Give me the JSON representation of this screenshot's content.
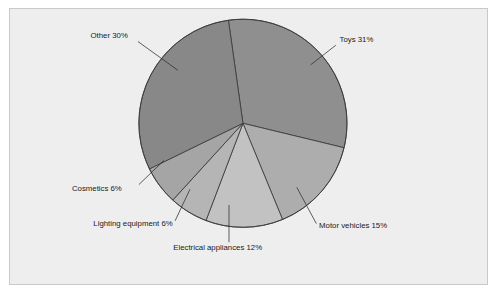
{
  "figure": {
    "background_color": "#ffffff",
    "panel_color": "#eeeeee",
    "panel_border_color": "#c9c9c9"
  },
  "chart_data": {
    "type": "pie",
    "title": "",
    "subtitle": "",
    "xlabel": "",
    "ylabel": "",
    "legend_position": "none",
    "grid": false,
    "labels_show_percent": true,
    "categories": [
      "Toys",
      "Motor vehicles",
      "Electrical appliances",
      "Lighting equipment",
      "Cosmetics",
      "Other"
    ],
    "values": [
      31,
      15,
      12,
      6,
      6,
      30
    ],
    "units": "%",
    "total": 100,
    "start_angle_deg": -98,
    "direction": "clockwise",
    "slices": [
      {
        "name": "Toys",
        "value": 31,
        "label": "Toys 31%",
        "color": "#8f8f8f",
        "label_x": 358,
        "label_y": 44,
        "label_anchor": "start",
        "leader_x1": 354,
        "leader_y1": 48,
        "leader_x2": 327,
        "leader_y2": 69
      },
      {
        "name": "Motor vehicles",
        "value": 15,
        "label": "Motor vehicles 15%",
        "color": "#adadad",
        "label_x": 336,
        "label_y": 245,
        "label_anchor": "start",
        "leader_x1": 333,
        "leader_y1": 240,
        "leader_x2": 312,
        "leader_y2": 201
      },
      {
        "name": "Electrical appliances",
        "value": 12,
        "label": "Electrical appliances 12%",
        "color": "#c2c2c2",
        "label_x": 179,
        "label_y": 268,
        "label_anchor": "start",
        "leader_x1": 239,
        "leader_y1": 260,
        "leader_x2": 239,
        "leader_y2": 220
      },
      {
        "name": "Lighting equipment",
        "value": 6,
        "label": "Lighting equipment 6%",
        "color": "#b5b5b5",
        "label_x": 93,
        "label_y": 243,
        "label_anchor": "start",
        "leader_x1": 181,
        "leader_y1": 237,
        "leader_x2": 197,
        "leader_y2": 203
      },
      {
        "name": "Cosmetics",
        "value": 6,
        "label": "Cosmetics 6%",
        "color": "#a5a5a5",
        "label_x": 70,
        "label_y": 205,
        "label_anchor": "start",
        "leader_x1": 142,
        "leader_y1": 198,
        "leader_x2": 169,
        "leader_y2": 172
      },
      {
        "name": "Other",
        "value": 30,
        "label": "Other 30%",
        "color": "#888888",
        "label_x": 90,
        "label_y": 40,
        "label_anchor": "start",
        "leader_x1": 141,
        "leader_y1": 44,
        "leader_x2": 184,
        "leader_y2": 75
      }
    ],
    "geometry": {
      "center_x": 254,
      "center_y": 132,
      "radius": 112
    }
  }
}
